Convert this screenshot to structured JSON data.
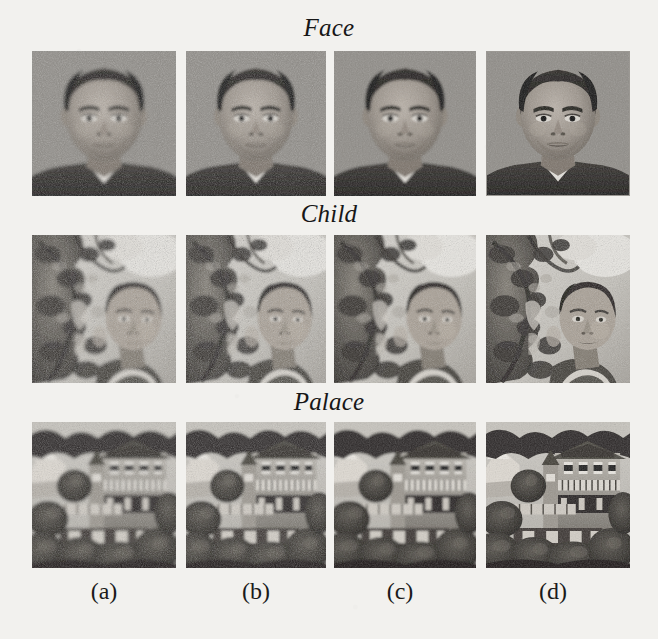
{
  "figure": {
    "background_color": "#f2f1ee",
    "rows": [
      {
        "id": "face",
        "title": "Face"
      },
      {
        "id": "child",
        "title": "Child"
      },
      {
        "id": "palace",
        "title": "Palace"
      }
    ],
    "column_labels": [
      "(a)",
      "(b)",
      "(c)",
      "(d)"
    ],
    "grid": {
      "rows": 3,
      "columns": 4,
      "cells": [
        {
          "row": "face",
          "column": "(a)",
          "subject": "face-portrait",
          "variant": "a"
        },
        {
          "row": "face",
          "column": "(b)",
          "subject": "face-portrait",
          "variant": "b"
        },
        {
          "row": "face",
          "column": "(c)",
          "subject": "face-portrait",
          "variant": "c"
        },
        {
          "row": "face",
          "column": "(d)",
          "subject": "face-portrait",
          "variant": "d"
        },
        {
          "row": "child",
          "column": "(a)",
          "subject": "child-foliage",
          "variant": "a"
        },
        {
          "row": "child",
          "column": "(b)",
          "subject": "child-foliage",
          "variant": "b"
        },
        {
          "row": "child",
          "column": "(c)",
          "subject": "child-foliage",
          "variant": "c"
        },
        {
          "row": "child",
          "column": "(d)",
          "subject": "child-foliage",
          "variant": "d"
        },
        {
          "row": "palace",
          "column": "(a)",
          "subject": "palace-building",
          "variant": "a"
        },
        {
          "row": "palace",
          "column": "(b)",
          "subject": "palace-building",
          "variant": "b"
        },
        {
          "row": "palace",
          "column": "(c)",
          "subject": "palace-building",
          "variant": "c"
        },
        {
          "row": "palace",
          "column": "(d)",
          "subject": "palace-building",
          "variant": "d"
        }
      ]
    },
    "palette": {
      "page": "#f2f1ee",
      "face_background": "#8d8d8d",
      "ink": "#1a1a1a"
    }
  }
}
